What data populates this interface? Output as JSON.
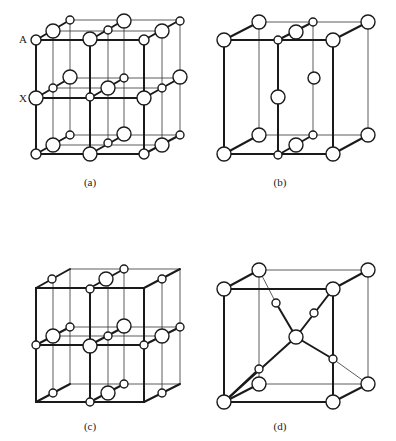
{
  "figure": {
    "panels": [
      {
        "id": "a",
        "caption": "(a)",
        "caption_pos": [
          90,
          182
        ],
        "side_labels": [
          {
            "text": "A",
            "pos": [
              23,
              39
            ]
          },
          {
            "text": "X",
            "pos": [
              23,
              98
            ]
          }
        ]
      },
      {
        "id": "b",
        "caption": "(b)",
        "caption_pos": [
          280,
          182
        ],
        "side_labels": []
      },
      {
        "id": "c",
        "caption": "(c)",
        "caption_pos": [
          90,
          426
        ],
        "side_labels": []
      },
      {
        "id": "d",
        "caption": "(d)",
        "caption_pos": [
          280,
          426
        ],
        "side_labels": []
      }
    ]
  },
  "colors": {
    "line": "#1a1a1a",
    "atom_fill": "#ffffff",
    "background": "#ffffff"
  },
  "geometry": {
    "a": {
      "thick": [
        [
          36,
          40,
          144,
          40
        ],
        [
          36,
          40,
          36,
          154
        ],
        [
          90,
          40,
          90,
          154
        ],
        [
          144,
          40,
          144,
          154
        ],
        [
          36,
          154,
          144,
          154
        ],
        [
          36,
          98,
          144,
          98
        ],
        [
          36,
          40,
          70,
          20
        ],
        [
          90,
          40,
          124,
          20
        ],
        [
          144,
          40,
          180,
          20
        ],
        [
          36,
          98,
          70,
          78
        ],
        [
          90,
          98,
          124,
          78
        ],
        [
          144,
          98,
          180,
          78
        ],
        [
          36,
          154,
          70,
          135
        ],
        [
          90,
          154,
          124,
          135
        ],
        [
          144,
          154,
          180,
          135
        ]
      ],
      "thin": [
        [
          70,
          20,
          180,
          20
        ],
        [
          180,
          20,
          180,
          135
        ],
        [
          53,
          31,
          162,
          31
        ],
        [
          53,
          88,
          162,
          88
        ],
        [
          53,
          145,
          162,
          145
        ],
        [
          70,
          78,
          180,
          78
        ],
        [
          70,
          135,
          180,
          135
        ],
        [
          53,
          31,
          53,
          145
        ],
        [
          70,
          20,
          70,
          135
        ],
        [
          108,
          30,
          108,
          143
        ],
        [
          124,
          20,
          124,
          135
        ],
        [
          162,
          31,
          162,
          145
        ]
      ],
      "atoms": [
        [
          36,
          40,
          5
        ],
        [
          90,
          39,
          7
        ],
        [
          144,
          40,
          5
        ],
        [
          53,
          31,
          7
        ],
        [
          108,
          30,
          4
        ],
        [
          162,
          31,
          7
        ],
        [
          70,
          20,
          4
        ],
        [
          124,
          21,
          7
        ],
        [
          180,
          21,
          4
        ],
        [
          36,
          98,
          7
        ],
        [
          90,
          97,
          4
        ],
        [
          144,
          98,
          7
        ],
        [
          53,
          88,
          4
        ],
        [
          108,
          88,
          7
        ],
        [
          162,
          88,
          4
        ],
        [
          70,
          77,
          7
        ],
        [
          124,
          78,
          4
        ],
        [
          180,
          77,
          7
        ],
        [
          36,
          154,
          5
        ],
        [
          90,
          154,
          7
        ],
        [
          144,
          154,
          5
        ],
        [
          53,
          145,
          7
        ],
        [
          108,
          143,
          4
        ],
        [
          162,
          145,
          7
        ],
        [
          70,
          135,
          4
        ],
        [
          124,
          134,
          7
        ],
        [
          180,
          135,
          4
        ]
      ]
    },
    "b": {
      "thick": [
        [
          224,
          40,
          333,
          40
        ],
        [
          224,
          40,
          224,
          154
        ],
        [
          278,
          40,
          278,
          154
        ],
        [
          333,
          40,
          333,
          154
        ],
        [
          224,
          154,
          333,
          154
        ],
        [
          224,
          40,
          259,
          22
        ],
        [
          278,
          40,
          313,
          22
        ],
        [
          333,
          40,
          368,
          22
        ],
        [
          224,
          154,
          259,
          135
        ],
        [
          278,
          155,
          313,
          135
        ],
        [
          333,
          154,
          368,
          135
        ]
      ],
      "thin": [
        [
          259,
          22,
          368,
          22
        ],
        [
          368,
          22,
          368,
          135
        ],
        [
          259,
          22,
          259,
          135
        ],
        [
          259,
          135,
          368,
          135
        ],
        [
          313,
          22,
          313,
          135
        ]
      ],
      "atoms": [
        [
          224,
          40,
          7
        ],
        [
          259,
          22,
          7
        ],
        [
          278,
          40,
          4
        ],
        [
          296,
          32,
          7
        ],
        [
          313,
          22,
          4
        ],
        [
          333,
          40,
          7
        ],
        [
          368,
          22,
          7
        ],
        [
          278,
          97,
          7
        ],
        [
          314,
          78,
          6
        ],
        [
          224,
          154,
          7
        ],
        [
          259,
          135,
          7
        ],
        [
          278,
          155,
          4
        ],
        [
          296,
          145,
          7
        ],
        [
          313,
          135,
          4
        ],
        [
          333,
          154,
          7
        ],
        [
          368,
          135,
          7
        ]
      ]
    },
    "c": {
      "thick": [
        [
          36,
          288,
          144,
          288
        ],
        [
          36,
          288,
          36,
          402
        ],
        [
          90,
          288,
          90,
          402
        ],
        [
          144,
          288,
          144,
          402
        ],
        [
          36,
          402,
          144,
          402
        ],
        [
          36,
          345,
          144,
          345
        ],
        [
          36,
          288,
          70,
          269
        ],
        [
          90,
          288,
          124,
          269
        ],
        [
          144,
          288,
          180,
          269
        ],
        [
          36,
          345,
          70,
          327
        ],
        [
          90,
          345,
          124,
          327
        ],
        [
          144,
          345,
          180,
          327
        ],
        [
          36,
          402,
          70,
          384
        ],
        [
          90,
          402,
          124,
          384
        ],
        [
          144,
          402,
          180,
          384
        ]
      ],
      "thin": [
        [
          70,
          269,
          180,
          269
        ],
        [
          180,
          269,
          180,
          384
        ],
        [
          70,
          269,
          70,
          384
        ],
        [
          70,
          384,
          180,
          384
        ],
        [
          124,
          269,
          124,
          384
        ],
        [
          53,
          279,
          53,
          393
        ],
        [
          108,
          279,
          108,
          393
        ],
        [
          162,
          279,
          162,
          393
        ],
        [
          53,
          336,
          162,
          336
        ],
        [
          70,
          327,
          180,
          327
        ]
      ],
      "atoms": [
        [
          52,
          279,
          4
        ],
        [
          90,
          289,
          4
        ],
        [
          106,
          279,
          7
        ],
        [
          124,
          269,
          4
        ],
        [
          162,
          279,
          4
        ],
        [
          36,
          345,
          4
        ],
        [
          90,
          346,
          7
        ],
        [
          144,
          345,
          4
        ],
        [
          53,
          336,
          7
        ],
        [
          108,
          336,
          4
        ],
        [
          162,
          336,
          7
        ],
        [
          70,
          327,
          4
        ],
        [
          124,
          326,
          7
        ],
        [
          180,
          327,
          4
        ],
        [
          90,
          402,
          4
        ],
        [
          53,
          393,
          4
        ],
        [
          108,
          393,
          7
        ],
        [
          162,
          393,
          4
        ],
        [
          124,
          384,
          4
        ]
      ]
    },
    "d": {
      "thick": [
        [
          224,
          289,
          333,
          289
        ],
        [
          224,
          289,
          224,
          402
        ],
        [
          333,
          289,
          333,
          402
        ],
        [
          224,
          402,
          333,
          402
        ],
        [
          224,
          289,
          259,
          270
        ],
        [
          333,
          289,
          368,
          270
        ],
        [
          224,
          402,
          259,
          384
        ],
        [
          333,
          402,
          368,
          384
        ],
        [
          224,
          402,
          296,
          337
        ],
        [
          296,
          337,
          333,
          289
        ],
        [
          296,
          337,
          276,
          303
        ],
        [
          296,
          337,
          333,
          359
        ],
        [
          224,
          402,
          259,
          369
        ]
      ],
      "thin": [
        [
          259,
          270,
          368,
          270
        ],
        [
          368,
          270,
          368,
          384
        ],
        [
          259,
          270,
          259,
          384
        ],
        [
          259,
          384,
          368,
          384
        ],
        [
          276,
          303,
          259,
          270
        ],
        [
          333,
          359,
          368,
          384
        ]
      ],
      "atoms": [
        [
          224,
          289,
          7
        ],
        [
          259,
          270,
          7
        ],
        [
          333,
          289,
          7
        ],
        [
          368,
          270,
          7
        ],
        [
          224,
          402,
          7
        ],
        [
          259,
          384,
          7
        ],
        [
          333,
          402,
          7
        ],
        [
          368,
          384,
          7
        ],
        [
          296,
          337,
          7
        ],
        [
          276,
          303,
          4
        ],
        [
          314,
          313,
          4
        ],
        [
          259,
          369,
          4
        ],
        [
          333,
          359,
          4
        ]
      ]
    }
  }
}
